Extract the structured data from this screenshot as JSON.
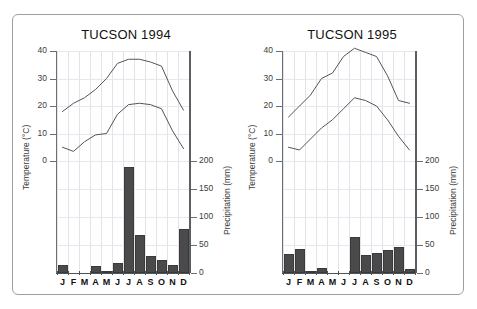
{
  "figure": {
    "background": "#ffffff",
    "frame_color": "#9aa0a6",
    "bar_color": "#4a4a4a",
    "line_color": "#555555"
  },
  "axes": {
    "temperature_label": "Temperature (°C)",
    "precipitation_label": "Precipitation (mm)",
    "temperature_ticks": [
      "0",
      "10",
      "20",
      "30",
      "40"
    ],
    "precipitation_ticks": [
      "0",
      "50",
      "100",
      "150",
      "200"
    ],
    "month_labels": [
      "J",
      "F",
      "M",
      "A",
      "M",
      "J",
      "J",
      "A",
      "S",
      "O",
      "N",
      "D"
    ]
  },
  "chart_data": [
    {
      "type": "line",
      "title": "TUCSON 1994",
      "xlabel": "",
      "ylabel": "Temperature (°C)",
      "y2label": "Precipitation (mm)",
      "categories": [
        "J",
        "F",
        "M",
        "A",
        "M",
        "J",
        "J",
        "A",
        "S",
        "O",
        "N",
        "D"
      ],
      "ylim": [
        0,
        40
      ],
      "y2lim": [
        0,
        200
      ],
      "grid": true,
      "legend": "none",
      "series": [
        {
          "name": "Maximum temperature",
          "unit": "°C",
          "axis": "left",
          "values": [
            18,
            21,
            23,
            26,
            30,
            35.5,
            37,
            37,
            36,
            34.5,
            25.5,
            18.5
          ]
        },
        {
          "name": "Minimum temperature",
          "unit": "°C",
          "axis": "left",
          "values": [
            5,
            3.5,
            7,
            9.5,
            10,
            17,
            20.5,
            21,
            20.5,
            19,
            11,
            4.5
          ]
        },
        {
          "name": "Precipitation",
          "unit": "mm",
          "axis": "right",
          "type": "bar",
          "values": [
            14,
            0,
            0,
            13,
            4,
            18,
            190,
            68,
            30,
            24,
            14,
            78
          ]
        }
      ]
    },
    {
      "type": "line",
      "title": "TUCSON 1995",
      "xlabel": "",
      "ylabel": "Temperature (°C)",
      "y2label": "Precipitation (mm)",
      "categories": [
        "J",
        "F",
        "M",
        "A",
        "M",
        "J",
        "J",
        "A",
        "S",
        "O",
        "N",
        "D"
      ],
      "ylim": [
        0,
        40
      ],
      "y2lim": [
        0,
        200
      ],
      "grid": true,
      "legend": "none",
      "series": [
        {
          "name": "Maximum temperature",
          "unit": "°C",
          "axis": "left",
          "values": [
            16,
            20,
            24,
            30,
            32,
            38,
            41,
            39.5,
            38,
            31,
            22,
            21
          ]
        },
        {
          "name": "Minimum temperature",
          "unit": "°C",
          "axis": "left",
          "values": [
            5,
            4,
            8,
            12,
            15,
            19,
            23,
            22,
            20,
            15,
            9,
            4
          ]
        },
        {
          "name": "Precipitation",
          "unit": "mm",
          "axis": "right",
          "type": "bar",
          "values": [
            34,
            42,
            4,
            9,
            0,
            0,
            65,
            32,
            35,
            41,
            46,
            8
          ]
        }
      ]
    }
  ]
}
